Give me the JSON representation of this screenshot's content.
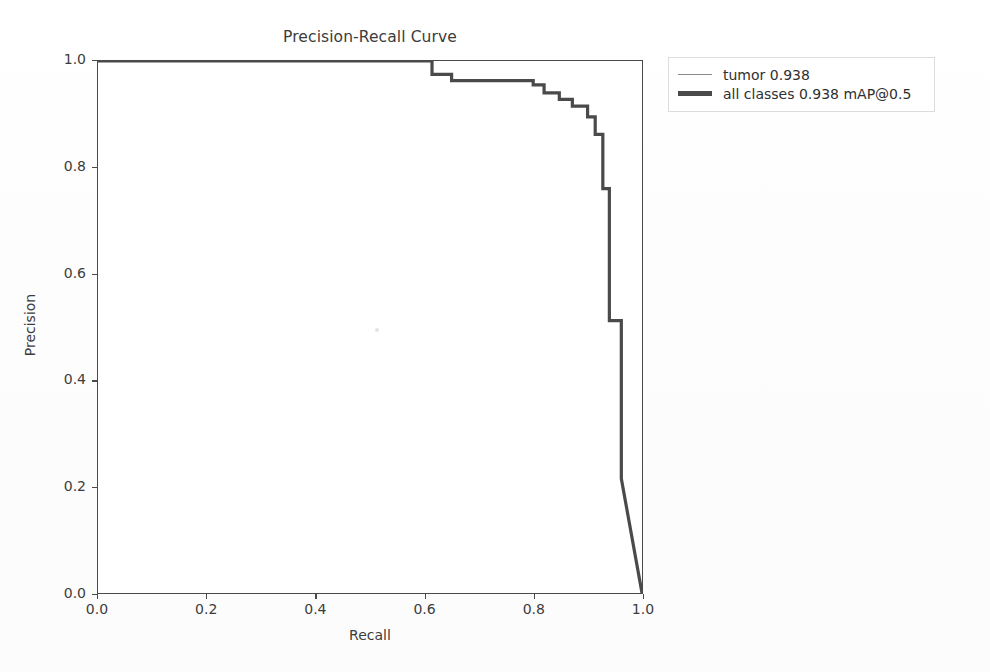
{
  "figure": {
    "background_color": "#ffffff",
    "axis_color": "#4a4a4a",
    "curve_color": "#4a4a4a",
    "thin_curve_color": "#8a8a8a"
  },
  "chart_data": {
    "type": "line",
    "title": "Precision-Recall Curve",
    "xlabel": "Recall",
    "ylabel": "Precision",
    "xlim": [
      0.0,
      1.0
    ],
    "ylim": [
      0.0,
      1.0
    ],
    "xticks": [
      "0.0",
      "0.2",
      "0.4",
      "0.6",
      "0.8",
      "1.0"
    ],
    "xtick_values": [
      0.0,
      0.2,
      0.4,
      0.6,
      0.8,
      1.0
    ],
    "yticks": [
      "0.0",
      "0.2",
      "0.4",
      "0.6",
      "0.8",
      "1.0"
    ],
    "ytick_values": [
      0.0,
      0.2,
      0.4,
      0.6,
      0.8,
      1.0
    ],
    "grid": false,
    "legend_position": "upper right outside",
    "series": [
      {
        "name": "tumor",
        "label": "tumor 0.938",
        "score": 0.938,
        "style": "thin",
        "color": "#8a8a8a",
        "x": [
          0.0,
          0.614,
          0.614,
          0.65,
          0.65,
          0.8,
          0.8,
          0.82,
          0.82,
          0.848,
          0.848,
          0.872,
          0.872,
          0.9,
          0.9,
          0.914,
          0.914,
          0.928,
          0.928,
          0.94,
          0.94,
          0.962,
          0.962,
          1.0
        ],
        "y": [
          1.0,
          1.0,
          0.975,
          0.975,
          0.963,
          0.963,
          0.955,
          0.955,
          0.94,
          0.94,
          0.928,
          0.928,
          0.915,
          0.915,
          0.895,
          0.895,
          0.862,
          0.862,
          0.76,
          0.76,
          0.512,
          0.512,
          0.215,
          0.0
        ]
      },
      {
        "name": "all classes",
        "label": "all classes 0.938 mAP@0.5",
        "score": 0.938,
        "map_at": "mAP@0.5",
        "style": "thick",
        "color": "#4a4a4a",
        "x": [
          0.0,
          0.614,
          0.614,
          0.65,
          0.65,
          0.8,
          0.8,
          0.82,
          0.82,
          0.848,
          0.848,
          0.872,
          0.872,
          0.9,
          0.9,
          0.914,
          0.914,
          0.928,
          0.928,
          0.94,
          0.94,
          0.962,
          0.962,
          1.0
        ],
        "y": [
          1.0,
          1.0,
          0.975,
          0.975,
          0.963,
          0.963,
          0.955,
          0.955,
          0.94,
          0.94,
          0.928,
          0.928,
          0.915,
          0.915,
          0.895,
          0.895,
          0.862,
          0.862,
          0.76,
          0.76,
          0.512,
          0.512,
          0.215,
          0.0
        ]
      }
    ]
  },
  "legend": {
    "entries": [
      {
        "label": "tumor 0.938",
        "style": "thin"
      },
      {
        "label": "all classes 0.938 mAP@0.5",
        "style": "thick"
      }
    ]
  }
}
